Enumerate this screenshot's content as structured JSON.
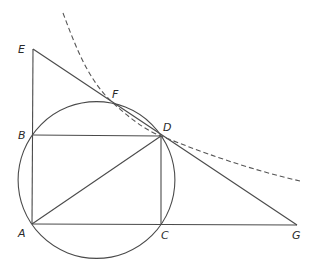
{
  "diagram": {
    "type": "geometry",
    "points": {
      "A": {
        "label": "A",
        "x": 32,
        "y": 224
      },
      "B": {
        "label": "B",
        "x": 32,
        "y": 135
      },
      "C": {
        "label": "C",
        "x": 161,
        "y": 225
      },
      "D": {
        "label": "D",
        "x": 161,
        "y": 136
      },
      "E": {
        "label": "E",
        "x": 33,
        "y": 49
      },
      "F": {
        "label": "F",
        "x": 112,
        "y": 102
      },
      "G": {
        "label": "G",
        "x": 297,
        "y": 225
      }
    },
    "segments": [
      "AE",
      "EG",
      "AG",
      "BD",
      "CD",
      "AD"
    ],
    "circle": {
      "cx": 96.5,
      "cy": 180,
      "r": 78.4,
      "passes_through": [
        "A",
        "B",
        "C",
        "D"
      ]
    },
    "dashed_curve": {
      "points": [
        [
          63,
          13
        ],
        [
          90,
          70
        ],
        [
          112,
          102
        ],
        [
          161,
          136
        ],
        [
          245,
          168
        ],
        [
          300,
          181
        ]
      ]
    },
    "colors": {
      "stroke": "#4a4a4a",
      "label": "#2a2a2a"
    }
  },
  "labels": {
    "A": "A",
    "B": "B",
    "C": "C",
    "D": "D",
    "E": "E",
    "F": "F",
    "G": "G"
  }
}
